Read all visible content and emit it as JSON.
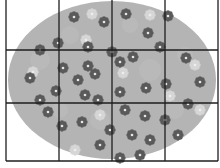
{
  "image": {
    "description": "Grayscale picture of an oval filled with flowers, overlaid by a 4 by 3 grid",
    "colors": {
      "background": "#ffffff",
      "oval_fill": "#b4b4b4",
      "dark_flower": "#5a5a5a",
      "light_flower": "#d6d6d6",
      "flower_center": "#e8e8e8",
      "grid_line": "#1e1e1e"
    },
    "grid": {
      "columns": 4,
      "rows": 3
    },
    "flowers": {
      "dark_count": 40,
      "light_count": 10
    }
  }
}
